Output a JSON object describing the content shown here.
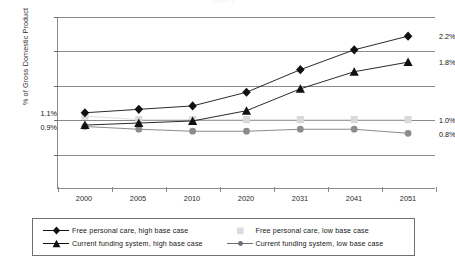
{
  "chart_data": {
    "type": "line",
    "title": "Chart 4",
    "xlabel": "",
    "ylabel": "% of Gross Domestic Product",
    "categories": [
      "2000",
      "2005",
      "2010",
      "2020",
      "2031",
      "2041",
      "2051"
    ],
    "ylim": [
      0.0,
      2.5
    ],
    "ytick_labels": [
      "0.0%",
      "0.5%",
      "1.0%",
      "1.5%",
      "2.0%",
      "2.5%"
    ],
    "ytick_values": [
      0.0,
      0.5,
      1.0,
      1.5,
      2.0,
      2.5
    ],
    "grid": true,
    "legend_position": "bottom",
    "series": [
      {
        "name": "Free personal care, high base case",
        "marker": "diamond",
        "color": "#111111",
        "values": [
          1.1,
          1.15,
          1.2,
          1.4,
          1.73,
          2.02,
          2.22
        ],
        "start_label": "1.1%",
        "end_label": "2.2%"
      },
      {
        "name": "Free personal care, low base case",
        "marker": "square",
        "color": "#d9d9d9",
        "values": [
          1.05,
          1.0,
          1.0,
          1.0,
          1.0,
          1.0,
          1.0
        ],
        "start_label": "",
        "end_label": "1.0%"
      },
      {
        "name": "Current funding system, high base case",
        "marker": "triangle",
        "color": "#111111",
        "values": [
          0.92,
          0.95,
          0.98,
          1.13,
          1.45,
          1.7,
          1.84
        ],
        "start_label": "0.9%",
        "end_label": "1.8%"
      },
      {
        "name": "Current funding system, low base case",
        "marker": "circle",
        "color": "#8c8c8c",
        "values": [
          0.9,
          0.86,
          0.83,
          0.83,
          0.86,
          0.86,
          0.8
        ],
        "start_label": "",
        "end_label": "0.8%"
      }
    ],
    "annotations": [
      {
        "text": "1.1%",
        "side": "left",
        "value": 1.1
      },
      {
        "text": "0.9%",
        "side": "left",
        "value": 0.9
      },
      {
        "text": "2.2%",
        "side": "right",
        "value": 2.22
      },
      {
        "text": "1.8%",
        "side": "right",
        "value": 1.84
      },
      {
        "text": "1.0%",
        "side": "right",
        "value": 1.0
      },
      {
        "text": "0.8%",
        "side": "right",
        "value": 0.8
      }
    ]
  }
}
